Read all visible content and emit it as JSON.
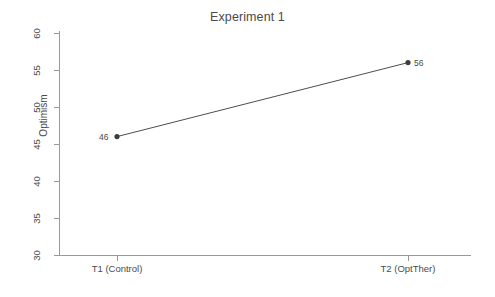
{
  "chart_data": {
    "type": "line",
    "title": "Experiment 1",
    "xlabel": "",
    "ylabel": "Optimism",
    "categories": [
      "T1 (Control)",
      "T2 (OptTher)"
    ],
    "values": [
      46,
      56
    ],
    "point_labels": [
      "46",
      "56"
    ],
    "series": [
      {
        "name": "Optimism",
        "values": [
          46,
          56
        ]
      }
    ],
    "ylim": [
      30,
      60
    ],
    "yticks": [
      30,
      35,
      40,
      45,
      50,
      55,
      60
    ],
    "ytick_labels": [
      "30",
      "35",
      "40",
      "45",
      "50",
      "55",
      "60"
    ],
    "xticks": [
      1,
      2
    ],
    "xtick_labels": [
      "T1 (Control)",
      "T2 (OptTher)"
    ],
    "grid": false,
    "legend": false,
    "legend_position": "none",
    "marker": "filled-circle",
    "line_color": "#4d4d4d",
    "marker_color": "#3d3d3d",
    "axis_color": "#999999",
    "text_color": "#4a4a4a",
    "background_color": "#ffffff"
  },
  "axes": {
    "y_title": "Optimism",
    "y_tick_0": "30",
    "y_tick_1": "35",
    "y_tick_2": "40",
    "y_tick_3": "45",
    "y_tick_4": "50",
    "y_tick_5": "55",
    "y_tick_6": "60",
    "x_tick_0": "T1 (Control)",
    "x_tick_1": "T2 (OptTher)"
  },
  "points": {
    "p0_label": "46",
    "p1_label": "56"
  },
  "header": {
    "title": "Experiment 1"
  }
}
